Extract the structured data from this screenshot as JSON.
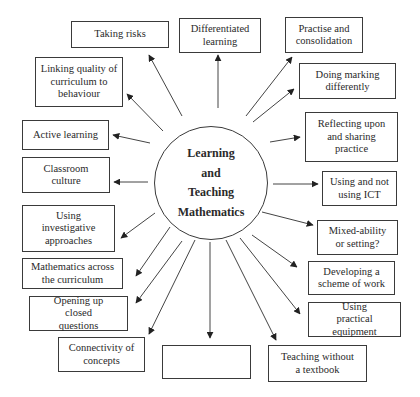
{
  "diagram": {
    "center": {
      "lines": [
        "Learning",
        "and",
        "Teaching",
        "Mathematics"
      ]
    },
    "nodes": [
      {
        "id": "taking-risks",
        "label": "Taking risks"
      },
      {
        "id": "differentiated-learning",
        "label": "Differentiated learning"
      },
      {
        "id": "practise-and-consolidation",
        "label": "Practise and consolidation"
      },
      {
        "id": "doing-marking-differently",
        "label": "Doing marking differently"
      },
      {
        "id": "linking-quality",
        "label": "Linking quality of curriculum to behaviour"
      },
      {
        "id": "active-learning",
        "label": "Active learning"
      },
      {
        "id": "reflecting-upon",
        "label": "Reflecting upon and sharing practice"
      },
      {
        "id": "classroom-culture",
        "label": "Classroom culture"
      },
      {
        "id": "using-ict",
        "label": "Using and not using ICT"
      },
      {
        "id": "investigative-approaches",
        "label": "Using investigative approaches"
      },
      {
        "id": "mixed-ability",
        "label": "Mixed-ability or setting?"
      },
      {
        "id": "maths-across-curriculum",
        "label": "Mathematics across the curriculum"
      },
      {
        "id": "scheme-of-work",
        "label": "Developing a scheme of work"
      },
      {
        "id": "opening-up-questions",
        "label": "Opening up closed questions"
      },
      {
        "id": "practical-equipment",
        "label": "Using practical equipment"
      },
      {
        "id": "connectivity-of-concepts",
        "label": "Connectivity of concepts"
      },
      {
        "id": "empty-box",
        "label": ""
      },
      {
        "id": "teaching-without-textbook",
        "label": "Teaching without a textbook"
      }
    ]
  }
}
